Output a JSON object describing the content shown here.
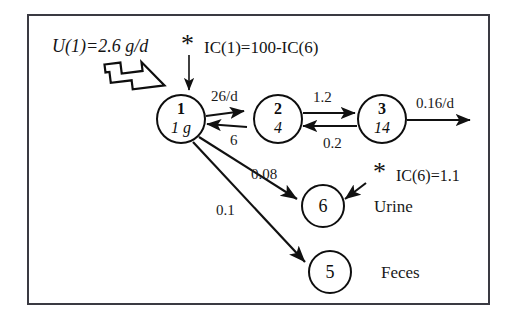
{
  "diagram": {
    "frame": {
      "border_color": "#3a3a42"
    },
    "nodes": [
      {
        "id": "1",
        "number": "1",
        "mass": "1 g",
        "cx": 181,
        "cy": 119,
        "r": 24
      },
      {
        "id": "2",
        "number": "2",
        "mass": "4",
        "cx": 278,
        "cy": 119,
        "r": 24
      },
      {
        "id": "3",
        "number": "3",
        "mass": "14",
        "cx": 382,
        "cy": 119,
        "r": 24
      },
      {
        "id": "6",
        "number": "6",
        "mass": "",
        "cx": 323,
        "cy": 206,
        "r": 21
      },
      {
        "id": "5",
        "number": "5",
        "mass": "",
        "cx": 330,
        "cy": 272,
        "r": 21
      }
    ],
    "input_label": "U(1)=2.6 g/d",
    "ic1_label": "IC(1)=100-IC(6)",
    "ic6_label": "IC(6)=1.1",
    "asterisk": "*",
    "rates": {
      "k12": "26/d",
      "k21": "6",
      "k23": "1.2",
      "k32": "0.2",
      "k3_out": "0.16/d",
      "k16": "0.08",
      "k15": "0.1"
    },
    "organ_labels": {
      "urine": "Urine",
      "feces": "Feces"
    }
  }
}
